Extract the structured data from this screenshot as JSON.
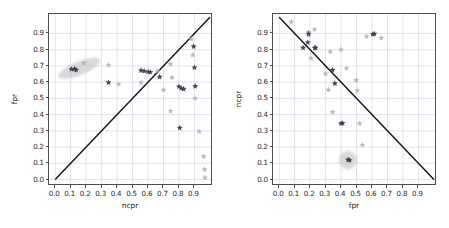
{
  "figure": {
    "background_color": "#ffffff",
    "axes_edge_color": "#4d4d4d",
    "grid_color": "#d8d8e8",
    "diagonal_color": "#1a1a1a",
    "marker_dark_color": "#3a3a4a",
    "marker_light_color": "#b0b0b8",
    "ellipse_color": "#b9b9b9"
  },
  "chart_data": [
    {
      "type": "scatter",
      "title": "",
      "xlabel": "ncpr",
      "ylabel": "fpr",
      "xlim": [
        -0.04,
        1.02
      ],
      "ylim": [
        -0.04,
        1.02
      ],
      "grid": true,
      "legend": "none",
      "xticks": [
        "0.0",
        "0.1",
        "0.2",
        "0.3",
        "0.4",
        "0.5",
        "0.6",
        "0.7",
        "0.8",
        "0.9"
      ],
      "xtick_values": [
        0.0,
        0.1,
        0.2,
        0.3,
        0.4,
        0.5,
        0.6,
        0.7,
        0.8,
        0.9
      ],
      "yticks": [
        "0.0",
        "0.1",
        "0.2",
        "0.3",
        "0.4",
        "0.5",
        "0.6",
        "0.7",
        "0.8",
        "0.9"
      ],
      "ytick_values": [
        0.0,
        0.1,
        0.2,
        0.3,
        0.4,
        0.5,
        0.6,
        0.7,
        0.8,
        0.9
      ],
      "reference_line": {
        "name": "identity-line",
        "x0": 0.0,
        "y0": 0.0,
        "x1": 1.0,
        "y1": 1.0
      },
      "confidence_region": {
        "name": "ellipse-region",
        "shape": "ellipse",
        "cx": 0.155,
        "cy": 0.685,
        "rx": 0.145,
        "ry": 0.042,
        "rotation_deg": -22
      },
      "series": [
        {
          "name": "dark-markers",
          "marker": "star",
          "color": "#3a3a4a",
          "points": [
            [
              0.105,
              0.68
            ],
            [
              0.125,
              0.682
            ],
            [
              0.135,
              0.675
            ],
            [
              0.345,
              0.598
            ],
            [
              0.555,
              0.672
            ],
            [
              0.575,
              0.668
            ],
            [
              0.6,
              0.663
            ],
            [
              0.615,
              0.662
            ],
            [
              0.675,
              0.632
            ],
            [
              0.8,
              0.572
            ],
            [
              0.815,
              0.562
            ],
            [
              0.83,
              0.558
            ],
            [
              0.805,
              0.318
            ],
            [
              0.895,
              0.82
            ],
            [
              0.9,
              0.69
            ],
            [
              0.905,
              0.575
            ]
          ]
        },
        {
          "name": "light-markers",
          "marker": "star",
          "color": "#b0b0b8",
          "points": [
            [
              0.185,
              0.718
            ],
            [
              0.345,
              0.705
            ],
            [
              0.41,
              0.588
            ],
            [
              0.555,
              0.598
            ],
            [
              0.66,
              0.668
            ],
            [
              0.7,
              0.552
            ],
            [
              0.745,
              0.712
            ],
            [
              0.755,
              0.628
            ],
            [
              0.745,
              0.422
            ],
            [
              0.88,
              0.865
            ],
            [
              0.89,
              0.768
            ],
            [
              0.905,
              0.5
            ],
            [
              0.93,
              0.295
            ],
            [
              0.96,
              0.142
            ],
            [
              0.965,
              0.062
            ],
            [
              0.968,
              0.012
            ]
          ]
        }
      ]
    },
    {
      "type": "scatter",
      "title": "",
      "xlabel": "fpr",
      "ylabel": "ncpr",
      "xlim": [
        -0.04,
        1.02
      ],
      "ylim": [
        -0.04,
        1.02
      ],
      "grid": true,
      "legend": "none",
      "xticks": [
        "0.0",
        "0.1",
        "0.2",
        "0.3",
        "0.4",
        "0.5",
        "0.6",
        "0.7",
        "0.8",
        "0.9"
      ],
      "xtick_values": [
        0.0,
        0.1,
        0.2,
        0.3,
        0.4,
        0.5,
        0.6,
        0.7,
        0.8,
        0.9
      ],
      "yticks": [
        "0.0",
        "0.1",
        "0.2",
        "0.3",
        "0.4",
        "0.5",
        "0.6",
        "0.7",
        "0.8",
        "0.9"
      ],
      "ytick_values": [
        0.0,
        0.1,
        0.2,
        0.3,
        0.4,
        0.5,
        0.6,
        0.7,
        0.8,
        0.9
      ],
      "reference_line": {
        "name": "anti-diagonal-line",
        "x0": 0.0,
        "y0": 1.0,
        "x1": 1.0,
        "y1": 0.0
      },
      "confidence_region": {
        "name": "circle-region",
        "shape": "circle",
        "cx": 0.445,
        "cy": 0.12,
        "rx": 0.058,
        "ry": 0.058,
        "rotation_deg": 0
      },
      "series": [
        {
          "name": "dark-markers",
          "marker": "star",
          "color": "#3a3a4a",
          "points": [
            [
              0.155,
              0.812
            ],
            [
              0.185,
              0.845
            ],
            [
              0.19,
              0.898
            ],
            [
              0.23,
              0.81
            ],
            [
              0.235,
              0.812
            ],
            [
              0.345,
              0.675
            ],
            [
              0.36,
              0.592
            ],
            [
              0.4,
              0.345
            ],
            [
              0.41,
              0.348
            ],
            [
              0.445,
              0.122
            ],
            [
              0.455,
              0.118
            ],
            [
              0.605,
              0.895
            ],
            [
              0.615,
              0.898
            ]
          ]
        },
        {
          "name": "light-markers",
          "marker": "star",
          "color": "#b0b0b8",
          "points": [
            [
              0.078,
              0.972
            ],
            [
              0.19,
              0.908
            ],
            [
              0.192,
              0.888
            ],
            [
              0.205,
              0.748
            ],
            [
              0.228,
              0.925
            ],
            [
              0.3,
              0.652
            ],
            [
              0.318,
              0.552
            ],
            [
              0.33,
              0.788
            ],
            [
              0.345,
              0.415
            ],
            [
              0.4,
              0.8
            ],
            [
              0.435,
              0.685
            ],
            [
              0.498,
              0.612
            ],
            [
              0.505,
              0.548
            ],
            [
              0.52,
              0.345
            ],
            [
              0.538,
              0.212
            ],
            [
              0.565,
              0.882
            ],
            [
              0.66,
              0.872
            ]
          ]
        }
      ]
    }
  ],
  "panels": [
    {
      "name": "left-panel",
      "frame": {
        "left": 48,
        "top": 13,
        "width": 164,
        "height": 172
      }
    },
    {
      "name": "right-panel",
      "frame": {
        "left": 48,
        "top": 13,
        "width": 164,
        "height": 172
      }
    }
  ]
}
